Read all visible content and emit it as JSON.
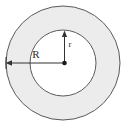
{
  "figure": {
    "name": "annulus-diagram",
    "canvas": {
      "width": 130,
      "height": 131,
      "background": "#ffffff"
    },
    "outer_circle": {
      "name": "outer-circle",
      "cx": 63,
      "cy": 63,
      "r": 57,
      "fill": "#ececec",
      "stroke": "#555555",
      "stroke_width": 1
    },
    "inner_circle": {
      "name": "inner-circle",
      "cx": 63,
      "cy": 63,
      "r": 33,
      "fill": "#ffffff",
      "stroke": "#555555",
      "stroke_width": 1
    },
    "center_point": {
      "name": "center-dot",
      "cx": 63,
      "cy": 63,
      "r": 2.2,
      "fill": "#1a1a1a"
    },
    "radius_outer": {
      "label": "R",
      "label_x": 36,
      "label_y": 58,
      "from_x": 63,
      "from_y": 63,
      "to_x": 7,
      "to_y": 63,
      "color": "#333333"
    },
    "radius_inner": {
      "label": "r",
      "label_x": 70,
      "label_y": 46,
      "from_x": 64,
      "from_y": 63,
      "to_x": 64,
      "to_y": 31,
      "color": "#333333"
    }
  }
}
